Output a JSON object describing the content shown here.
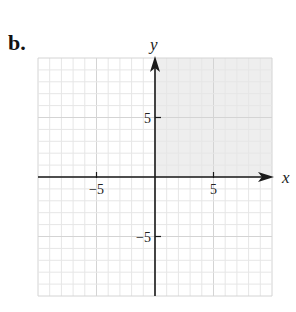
{
  "part_label": "b.",
  "colors": {
    "grid_minor": "#e6e6e6",
    "grid_major": "#d4d4d4",
    "shade": "#eeeeee",
    "axis": "#1a1a1a"
  },
  "chart_data": {
    "type": "region",
    "title": "",
    "xlabel": "x",
    "ylabel": "y",
    "xlim": [
      -10,
      10
    ],
    "ylim": [
      -10,
      10
    ],
    "grid": true,
    "grid_step": 1,
    "x_ticks": [
      {
        "value": -5,
        "label": "−5"
      },
      {
        "value": 5,
        "label": "5"
      }
    ],
    "y_ticks": [
      {
        "value": 5,
        "label": "5"
      },
      {
        "value": -5,
        "label": "−5"
      }
    ],
    "shaded_region": {
      "description": "First quadrant",
      "inequalities": [
        "x >= 0",
        "y >= 0"
      ],
      "x_range": [
        0,
        10
      ],
      "y_range": [
        0,
        10
      ]
    }
  }
}
